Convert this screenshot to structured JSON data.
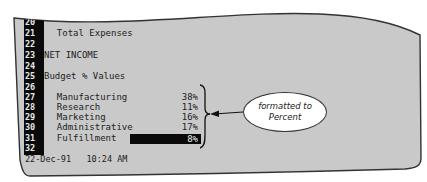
{
  "spreadsheet": {
    "rows": [
      {
        "num": "20",
        "label": "",
        "value": ""
      },
      {
        "num": "21",
        "label": "  Total Expenses",
        "value": ""
      },
      {
        "num": "22",
        "label": "",
        "value": ""
      },
      {
        "num": "23",
        "label": "NET INCOME",
        "value": ""
      },
      {
        "num": "24",
        "label": "",
        "value": ""
      },
      {
        "num": "25",
        "label": "Budget % Values",
        "value": ""
      },
      {
        "num": "26",
        "label": "",
        "value": ""
      },
      {
        "num": "27",
        "label": "  Manufacturing",
        "value": "38%"
      },
      {
        "num": "28",
        "label": "  Research",
        "value": "11%"
      },
      {
        "num": "29",
        "label": "  Marketing",
        "value": "16%"
      },
      {
        "num": "30",
        "label": "  Administrative",
        "value": "17%"
      },
      {
        "num": "31",
        "label": "  Fulfillment",
        "value": "8%"
      },
      {
        "num": "32",
        "label": "",
        "value": ""
      }
    ],
    "selected_cell_value": "8%",
    "status_date": "22-Dec-91",
    "status_time": "10:24 AM"
  },
  "annotation": {
    "line1": "formatted to",
    "line2": "Percent"
  },
  "colors": {
    "screen_bg": "#c8c8c8",
    "row_header_bg": "#0a0a0a",
    "highlight": "#0a0a0a"
  }
}
